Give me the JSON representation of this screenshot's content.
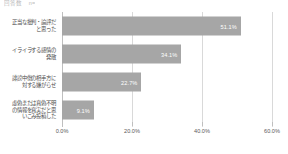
{
  "header_note": "回答数　n=",
  "chart_data": {
    "type": "bar",
    "orientation": "horizontal",
    "title": "",
    "subtitle": "",
    "xlabel": "",
    "ylabel": "",
    "xlim": [
      0,
      60
    ],
    "grid": true,
    "legend": false,
    "bar_color": "#a6a6a6",
    "value_label_color": "#ffffff",
    "gridline_color": "#d9d9d9",
    "categories": [
      "正当な批判・論評だと思った",
      "イライラする感情の発散",
      "誹謗中傷の相手方に対する嫌がらせ",
      "虚偽または真偽不明の情報を真実だと思いこみ投稿した"
    ],
    "category_lines": [
      [
        "正当な批判・論評だ",
        "と思った"
      ],
      [
        "イライラする感情の",
        "発散"
      ],
      [
        "誹謗中傷の相手方に",
        "対する嫌がらせ"
      ],
      [
        "虚偽または真偽不明",
        "の情報を真実だと思",
        "いこみ投稿した"
      ]
    ],
    "values": [
      51.1,
      34.1,
      22.7,
      9.1
    ],
    "value_labels": [
      "51.1%",
      "34.1%",
      "22.7%",
      "9.1%"
    ],
    "xticks": [
      0,
      20,
      40,
      60
    ],
    "xtick_labels": [
      "0.0%",
      "20.0%",
      "40.0%",
      "60.0%"
    ]
  }
}
